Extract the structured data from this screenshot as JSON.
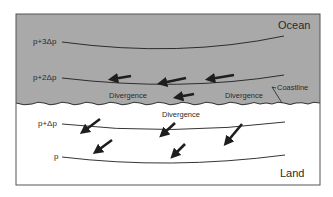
{
  "diagram": {
    "title": "",
    "regions": {
      "ocean": {
        "label": "Ocean",
        "fill": "#a9a9a9"
      },
      "land": {
        "label": "Land",
        "fill": "#ffffff"
      }
    },
    "coastline_label": "Coastline",
    "isobars": [
      {
        "label": "p+3Δp",
        "region": "ocean"
      },
      {
        "label": "p+2Δp",
        "region": "ocean"
      },
      {
        "label": "p+Δp",
        "region": "land"
      },
      {
        "label": "p",
        "region": "land"
      }
    ],
    "divergence_labels": [
      {
        "text": "Divergence",
        "region": "ocean",
        "position": "left"
      },
      {
        "text": "Divergence",
        "region": "ocean",
        "position": "right"
      },
      {
        "text": "Divergence",
        "region": "land",
        "position": "center"
      }
    ],
    "flow_arrows": {
      "ocean": "westward (pointing left), along isobars",
      "land": "southwest (pointing down-left), across isobars"
    },
    "colors": {
      "ocean_fill": "#a9a9a9",
      "line": "#1e1e1e",
      "frame": "#555555"
    }
  }
}
